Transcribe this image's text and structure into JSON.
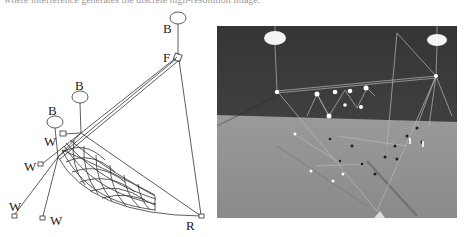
{
  "caption": {
    "text": "where interference generates the discrete high-resolution image."
  },
  "diagram": {
    "stroke_color": "#333333",
    "balloons": [
      {
        "label": "B",
        "cx": 178,
        "cy": 18,
        "rx": 8,
        "ry": 6,
        "label_x": 163,
        "label_y": 32,
        "tether_to": [
          178,
          56
        ]
      },
      {
        "label": "B",
        "cx": 80,
        "cy": 97,
        "rx": 8,
        "ry": 6,
        "label_x": 76,
        "label_y": 89,
        "tether_to": [
          81,
          132
        ]
      },
      {
        "label": "B",
        "cx": 55,
        "cy": 122,
        "rx": 8,
        "ry": 6,
        "label_x": 48,
        "label_y": 114,
        "tether_to": [
          58,
          155
        ]
      }
    ],
    "nodes": [
      {
        "id": "F",
        "label": "F",
        "x": 178,
        "y": 58,
        "label_x": 163,
        "label_y": 62
      },
      {
        "id": "R",
        "label": "R",
        "x": 201,
        "y": 216,
        "label_x": 186,
        "label_y": 230
      },
      {
        "id": "J1",
        "x": 81,
        "y": 133
      },
      {
        "id": "J2",
        "x": 58,
        "y": 157
      }
    ],
    "winches": [
      {
        "label": "W",
        "box_x": 60,
        "box_y": 132,
        "label_x": 44,
        "label_y": 146,
        "anchor": [
          81,
          133
        ]
      },
      {
        "label": "W",
        "box_x": 38,
        "box_y": 162,
        "label_x": 24,
        "label_y": 170,
        "anchor": [
          58,
          157
        ]
      },
      {
        "label": "W",
        "box_x": 13,
        "box_y": 214,
        "label_x": 10,
        "label_y": 210,
        "anchor": [
          58,
          157
        ]
      },
      {
        "label": "W",
        "box_x": 40,
        "box_y": 216,
        "label_x": 50,
        "label_y": 224,
        "anchor": [
          58,
          157
        ]
      }
    ]
  },
  "photo": {
    "description": "Photograph of the balloon-suspended rig over a field",
    "sky_color": "#3c3c3c",
    "ground_color": "#8c8c8c",
    "balloons": [
      {
        "cx": 60,
        "cy": 13
      },
      {
        "cx": 220,
        "cy": 15
      }
    ],
    "markers_bright": [
      [
        0,
        0
      ],
      [
        35,
        0
      ],
      [
        53,
        -1
      ],
      [
        67,
        -1
      ],
      [
        83,
        -3
      ],
      [
        45,
        18
      ],
      [
        64,
        10
      ],
      [
        83,
        13
      ]
    ]
  }
}
